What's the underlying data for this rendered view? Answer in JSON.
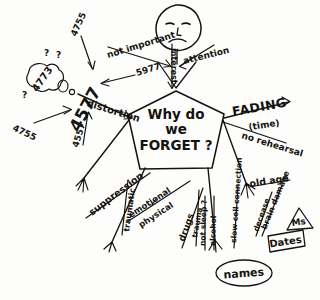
{
  "figure": {
    "face": {
      "expression": "frowning-face",
      "eyes": 2,
      "mouth": "frown"
    },
    "center_node": {
      "shape": "pentagon",
      "line1": "Why do",
      "line2": "we",
      "line3": "FORGET ?"
    }
  },
  "branches": {
    "upper_left": {
      "label": "not important"
    },
    "upper_center": {
      "label": "interest",
      "orientation": "vertical"
    },
    "upper_right": {
      "label": "attention"
    },
    "left": {
      "label": "distortion"
    },
    "right_top": {
      "label": "FADING",
      "sub": "(time)"
    },
    "right_bottom": {
      "label": "no rehearsal"
    },
    "lower_left_a": {
      "label": "suppression"
    },
    "lower_left_b": {
      "label": "traumatic",
      "orientation": "vertical"
    },
    "lower_left_c": {
      "label": "emotional"
    },
    "lower_left_d": {
      "label": "physical"
    },
    "lower_center_a": {
      "label": "drugs"
    },
    "lower_center_b": {
      "label": "not sleep ?",
      "orientation": "vertical"
    },
    "lower_center_c": {
      "label": "alcohol",
      "orientation": "vertical"
    },
    "lower_right_a": {
      "label": "old age"
    },
    "lower_right_b": {
      "label": "slow cell connection",
      "orientation": "vertical"
    },
    "lower_right_c": {
      "label": "brain damage"
    },
    "lower_right_d": {
      "label": "trauma",
      "orientation": "vertical"
    },
    "lower_right_e": {
      "label": "decease",
      "orientation": "vertical"
    }
  },
  "examples": {
    "cloud": {
      "shape": "cloud",
      "text": "4773",
      "marks": [
        "?",
        "?",
        "?"
      ]
    },
    "big_number": {
      "text": "4577",
      "orientation": "rotated"
    },
    "arrow_labels": [
      {
        "text": "4755",
        "position": "top"
      },
      {
        "text": "5977",
        "position": "upper-right"
      },
      {
        "text": "4755",
        "position": "lower-left"
      },
      {
        "text": "4557",
        "position": "bottom"
      }
    ],
    "oval_names": {
      "shape": "oval",
      "text": "names"
    },
    "box_dates": {
      "shape": "box",
      "text": "Dates"
    },
    "triangle_maths": {
      "shape": "triangle",
      "text": "Ms"
    }
  },
  "colors": {
    "ink": "#15130f",
    "paper": "#fdfdfb"
  }
}
